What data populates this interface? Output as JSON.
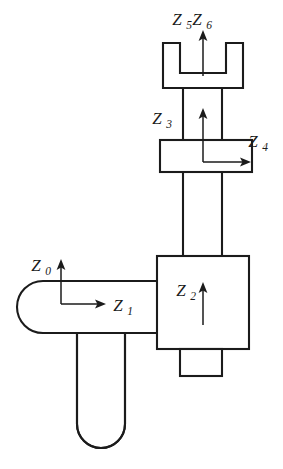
{
  "figure": {
    "type": "technical-line-drawing",
    "background_color": "#ffffff",
    "line_color": "#1b1b1b"
  },
  "axes": [
    {
      "id": "z0",
      "label": "Z",
      "subscript": "0",
      "full_label": "Z0",
      "direction": "up",
      "label_x": 30,
      "label_y": 271,
      "sub_x": 44,
      "sub_y": 275
    },
    {
      "id": "z1",
      "label": "Z",
      "subscript": "1",
      "full_label": "Z1",
      "direction": "right",
      "label_x": 112,
      "label_y": 310,
      "sub_x": 125,
      "sub_y": 314
    },
    {
      "id": "z2",
      "label": "Z",
      "subscript": "2",
      "full_label": "Z2",
      "direction": "up",
      "label_x": 178,
      "label_y": 296,
      "sub_x": 191,
      "sub_y": 300
    },
    {
      "id": "z3",
      "label": "Z",
      "subscript": "3",
      "full_label": "Z3",
      "direction": "up",
      "label_x": 157,
      "label_y": 124,
      "sub_x": 170,
      "sub_y": 128
    },
    {
      "id": "z4",
      "label": "Z",
      "subscript": "4",
      "full_label": "Z4",
      "direction": "right",
      "label_x": 253,
      "label_y": 147,
      "sub_x": 266,
      "sub_y": 151
    },
    {
      "id": "z5",
      "label": "Z",
      "subscript": "5",
      "full_label": "Z5",
      "direction": "up",
      "label_x": 177,
      "label_y": 25,
      "sub_x": 189,
      "sub_y": 29
    },
    {
      "id": "z6",
      "label": "Z",
      "subscript": "6",
      "full_label": "Z6",
      "direction": "up",
      "label_x": 196,
      "label_y": 25,
      "sub_x": 209,
      "sub_y": 29
    }
  ],
  "parts": [
    {
      "id": "gripper-fork",
      "name": "gripper-fork",
      "shape": "u-shape"
    },
    {
      "id": "wrist-shaft",
      "name": "wrist-shaft",
      "shape": "twin-rails"
    },
    {
      "id": "wrist-block",
      "name": "wrist-joint-block",
      "shape": "rectangle"
    },
    {
      "id": "lower-shaft",
      "name": "lower-shaft",
      "shape": "twin-rails"
    },
    {
      "id": "body-box",
      "name": "main-body-box",
      "shape": "rectangle"
    },
    {
      "id": "body-stub",
      "name": "body-bottom-stub",
      "shape": "rectangle"
    },
    {
      "id": "body-top-stub",
      "name": "body-top-stub",
      "shape": "rectangle"
    },
    {
      "id": "horizontal-arm",
      "name": "horizontal-arm",
      "shape": "stadium"
    },
    {
      "id": "vertical-leg",
      "name": "vertical-leg-column",
      "shape": "rounded-bottom"
    }
  ]
}
